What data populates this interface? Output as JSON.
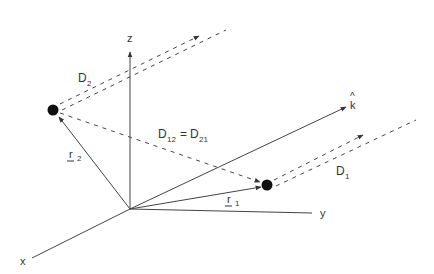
{
  "diagram": {
    "colors": {
      "line": "#444444",
      "text": "#333333",
      "particle": "#111111",
      "background": "#ffffff"
    },
    "origin": {
      "x": 130,
      "y": 209
    },
    "axes": {
      "x": {
        "label": "x",
        "end": [
          32,
          258
        ]
      },
      "y": {
        "label": "y",
        "end": [
          312,
          213
        ]
      },
      "z": {
        "label": "z",
        "end": [
          130,
          50
        ]
      }
    },
    "direction_vector": {
      "label": "k",
      "accent": "^",
      "end": [
        346,
        107
      ]
    },
    "particles": [
      {
        "id": "1",
        "position": [
          267,
          185
        ]
      },
      {
        "id": "2",
        "position": [
          53,
          110
        ]
      }
    ],
    "vectors": {
      "r1": {
        "label": "r",
        "subscript": "1"
      },
      "r2": {
        "label": "r",
        "subscript": "2"
      }
    },
    "distances": {
      "D1": {
        "label": "D",
        "subscript": "1"
      },
      "D2": {
        "label": "D",
        "subscript": "2"
      },
      "D12": {
        "label_left": "D",
        "sub_left": "12",
        "equals": "=",
        "label_right": "D",
        "sub_right": "21"
      }
    }
  }
}
